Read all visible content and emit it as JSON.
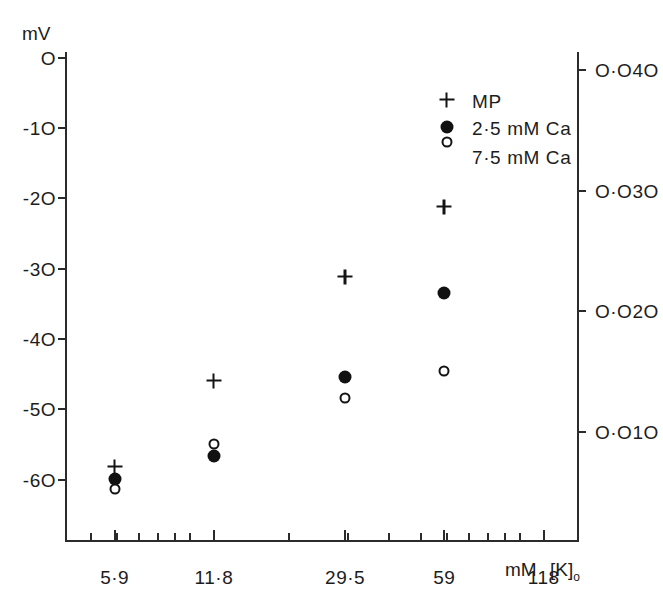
{
  "chart_data": {
    "type": "scatter",
    "title": "",
    "xlabel": "mM [K]o",
    "ylabel": "mV",
    "ylabel_right": "",
    "xscale": "log",
    "xlim": [
      4.2,
      150
    ],
    "ylim": [
      -66,
      2
    ],
    "grid": false,
    "legend_position": "upper-right-inside",
    "x_tick_labels": [
      "5·9",
      "11·8",
      "29·5",
      "59",
      "118"
    ],
    "x_tick_values": [
      5.9,
      11.8,
      29.5,
      59,
      118
    ],
    "x_axis_unit": "mM",
    "x_axis_symbol": "[K]",
    "x_axis_subscript": "o",
    "y_tick_labels_left": [
      "O",
      "-1O",
      "-2O",
      "-3O",
      "-4O",
      "-5O",
      "-6O"
    ],
    "y_tick_values_left": [
      0,
      -10,
      -20,
      -30,
      -40,
      -50,
      -60
    ],
    "y_tick_labels_right": [
      "O·O4O",
      "O·O3O",
      "O·O2O",
      "O·O1O"
    ],
    "y_tick_values_right": [
      0.04,
      0.03,
      0.02,
      0.01
    ],
    "series": [
      {
        "name": "MP",
        "marker": "plus",
        "x": [
          5.9,
          11.8,
          29.5,
          59
        ],
        "values": [
          -58.2,
          -46.0,
          -31.2,
          -21.2
        ]
      },
      {
        "name": "2·5 mM Ca",
        "marker": "filled-circle",
        "x": [
          5.9,
          11.8,
          29.5,
          59
        ],
        "values": [
          -59.9,
          -56.7,
          -45.4,
          -33.5
        ]
      },
      {
        "name": "7·5 mM Ca",
        "marker": "open-circle",
        "x": [
          5.9,
          11.8,
          29.5,
          59
        ],
        "values": [
          -61.4,
          -55.0,
          -48.4,
          -44.5
        ]
      }
    ]
  },
  "legend": {
    "entries": [
      {
        "marker": "plus",
        "label": "MP"
      },
      {
        "marker": "filled-circle",
        "label": "2·5 mM Ca"
      },
      {
        "marker": "open-circle",
        "label": "7·5 mM Ca"
      }
    ]
  },
  "colors": {
    "ink": "#1d1d1d",
    "axis": "#2b2b2b",
    "marker": "#141414",
    "background": "#ffffff"
  }
}
